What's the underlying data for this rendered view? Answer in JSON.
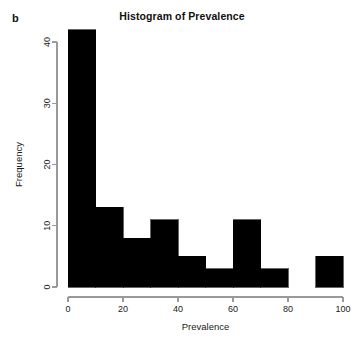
{
  "panel": {
    "label": "b"
  },
  "chart_data": {
    "type": "bar",
    "title": "Histogram of Prevalence",
    "xlabel": "Prevalence",
    "ylabel": "Frequency",
    "categories": [
      "0-10",
      "10-20",
      "20-30",
      "30-40",
      "40-50",
      "50-60",
      "60-70",
      "70-80",
      "80-90",
      "90-100"
    ],
    "bin_edges": [
      0,
      10,
      20,
      30,
      40,
      50,
      60,
      70,
      80,
      90,
      100
    ],
    "values": [
      42,
      13,
      8,
      11,
      5,
      3,
      11,
      3,
      0,
      5
    ],
    "bar_color": "#000000",
    "xlim": [
      0,
      100
    ],
    "ylim": [
      0,
      42
    ],
    "xticks": [
      0,
      20,
      40,
      60,
      80,
      100
    ],
    "xtick_labels": [
      "0",
      "20",
      "40",
      "60",
      "80",
      "100"
    ],
    "yticks": [
      0,
      10,
      20,
      30,
      40
    ],
    "ytick_labels": [
      "0",
      "10",
      "20",
      "30",
      "40"
    ],
    "grid": false,
    "legend": false
  }
}
